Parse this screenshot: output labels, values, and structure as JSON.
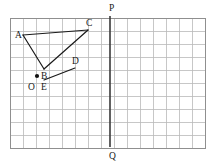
{
  "figure": {
    "background_color": "#ffffff",
    "grid": {
      "origin_px": {
        "x": 10,
        "y": 18
      },
      "cell_size_px": 13,
      "columns": 15,
      "rows": 10,
      "line_color": "#b9b9b9",
      "border_color": "#8f8f8f",
      "grid_on": true
    },
    "axis_line": {
      "name": "PQ",
      "orientation": "vertical",
      "x_px": 110,
      "y_top_px": 16,
      "y_bottom_px": 147,
      "color": "#3a3a3a",
      "width_px": 1.6,
      "endpoints": [
        {
          "label": "P",
          "x": 110,
          "y": 16,
          "label_x": 109,
          "label_y": 11
        },
        {
          "label": "Q",
          "x": 110,
          "y": 147,
          "label_x": 109,
          "label_y": 159
        }
      ]
    },
    "points": [
      {
        "id": "A",
        "x": 23,
        "y": 35,
        "label": "A",
        "label_x": 15,
        "label_y": 38,
        "marker": false
      },
      {
        "id": "B",
        "x": 44,
        "y": 69,
        "label": "B",
        "label_x": 41,
        "label_y": 79,
        "marker": false
      },
      {
        "id": "C",
        "x": 88,
        "y": 30,
        "label": "C",
        "label_x": 86,
        "label_y": 26,
        "marker": false
      },
      {
        "id": "D",
        "x": 75,
        "y": 68,
        "label": "D",
        "label_x": 72,
        "label_y": 64,
        "marker": false
      },
      {
        "id": "E",
        "x": 44,
        "y": 80,
        "label": "E",
        "label_x": 41,
        "label_y": 90,
        "marker": false
      },
      {
        "id": "O",
        "x": 37,
        "y": 76,
        "label": "O",
        "label_x": 28,
        "label_y": 90,
        "marker": true
      }
    ],
    "segments": [
      {
        "id": "AB",
        "from": "A",
        "to": "B",
        "color": "#1a1a1a",
        "width_px": 1.2
      },
      {
        "id": "AC",
        "from": "A",
        "to": "C",
        "color": "#1a1a1a",
        "width_px": 1.2
      },
      {
        "id": "BC",
        "from": "B",
        "to": "C",
        "color": "#1a1a1a",
        "width_px": 1.2
      },
      {
        "id": "ED",
        "from": "E",
        "to": "D",
        "color": "#1a1a1a",
        "width_px": 1.2
      }
    ],
    "marker": {
      "name": "origin-dot",
      "radius_px": 2.1,
      "color": "#111111"
    },
    "labels": {
      "A": "A",
      "B": "B",
      "C": "C",
      "D": "D",
      "E": "E",
      "O": "O",
      "P": "P",
      "Q": "Q"
    }
  }
}
